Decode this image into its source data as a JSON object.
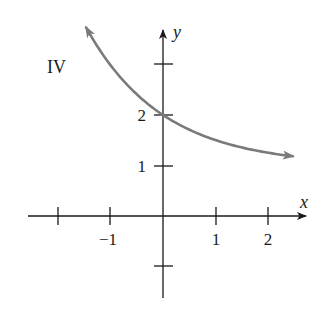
{
  "chart_data": {
    "type": "line",
    "title": "",
    "panel_label": "IV",
    "xlabel": "x",
    "ylabel": "y",
    "function": "y = 1 + 2^(-x)",
    "xlim": [
      -2.6,
      2.9
    ],
    "ylim": [
      -1.6,
      3.7
    ],
    "x_ticks": [
      -2,
      -1,
      1,
      2
    ],
    "x_tick_labels": [
      {
        "value": -1,
        "label": "−1"
      },
      {
        "value": 1,
        "label": "1"
      },
      {
        "value": 2,
        "label": "2"
      }
    ],
    "y_ticks": [
      -1,
      1,
      2,
      3
    ],
    "y_tick_labels": [
      {
        "value": 1,
        "label": "1"
      },
      {
        "value": 2,
        "label": "2"
      }
    ],
    "series": [
      {
        "name": "IV",
        "color": "#7a7a7a",
        "x": [
          -1.45,
          -1.0,
          -0.5,
          0.0,
          0.5,
          1.0,
          1.5,
          2.0,
          2.45
        ],
        "y": [
          3.73,
          3.0,
          2.41,
          2.0,
          1.71,
          1.5,
          1.35,
          1.25,
          1.18
        ],
        "arrow_both_ends": true
      }
    ],
    "grid": false,
    "legend": null
  },
  "colors": {
    "axis": "#1a1a1a",
    "curve": "#7a7a7a"
  }
}
